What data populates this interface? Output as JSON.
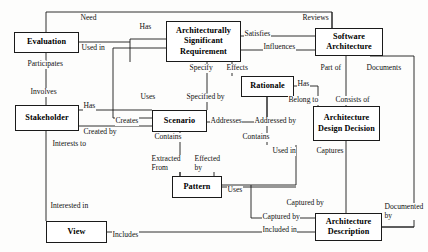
{
  "diagram": {
    "type": "entity-relationship-diagram",
    "stroke_color": "#1a1a1a",
    "background_color": "#fdfdfc",
    "nodes": [
      {
        "id": "evaluation",
        "label": "Evaluation",
        "x": 14,
        "y": 32,
        "w": 65,
        "h": 21
      },
      {
        "id": "stakeholder",
        "label": "Stakeholder",
        "x": 15,
        "y": 105,
        "w": 64,
        "h": 26
      },
      {
        "id": "view",
        "label": "View",
        "x": 46,
        "y": 221,
        "w": 61,
        "h": 22
      },
      {
        "id": "scenario",
        "label": "Scenario",
        "x": 152,
        "y": 110,
        "w": 55,
        "h": 22
      },
      {
        "id": "pattern",
        "label": "Pattern",
        "x": 172,
        "y": 176,
        "w": 50,
        "h": 22
      },
      {
        "id": "asr",
        "label": "Architecturally Significant Requirement",
        "x": 166,
        "y": 21,
        "w": 75,
        "h": 41
      },
      {
        "id": "rationale",
        "label": "Rationale",
        "x": 241,
        "y": 76,
        "w": 53,
        "h": 21
      },
      {
        "id": "software_architecture",
        "label": "Software Architecture",
        "x": 315,
        "y": 28,
        "w": 68,
        "h": 28
      },
      {
        "id": "architecture_design_decision",
        "label": "Architecture Design Decision",
        "x": 313,
        "y": 106,
        "w": 67,
        "h": 35
      },
      {
        "id": "architecture_description",
        "label": "Architecture Description",
        "x": 315,
        "y": 213,
        "w": 67,
        "h": 28
      }
    ],
    "edge_labels": [
      {
        "id": "need",
        "text": "Need",
        "x": 80,
        "y": 14
      },
      {
        "id": "has_top",
        "text": "Has",
        "x": 139,
        "y": 23
      },
      {
        "id": "reviews",
        "text": "Reviews",
        "x": 302,
        "y": 14
      },
      {
        "id": "satisfies",
        "text": "Satisfies",
        "x": 244,
        "y": 33
      },
      {
        "id": "influences",
        "text": "Influences",
        "x": 273,
        "y": 45
      },
      {
        "id": "used_in_top",
        "text": "Used in",
        "x": 81,
        "y": 44
      },
      {
        "id": "participates",
        "text": "Participates",
        "x": 27,
        "y": 59
      },
      {
        "id": "specify",
        "text": "Specify",
        "x": 190,
        "y": 65
      },
      {
        "id": "effects",
        "text": "Effects",
        "x": 227,
        "y": 66
      },
      {
        "id": "part_of",
        "text": "Part of",
        "x": 320,
        "y": 65
      },
      {
        "id": "documents",
        "text": "Documents",
        "x": 370,
        "y": 65
      },
      {
        "id": "involves",
        "text": "Involves",
        "x": 30,
        "y": 88
      },
      {
        "id": "has_rat",
        "text": "Has",
        "x": 296,
        "y": 80
      },
      {
        "id": "uses_scn",
        "text": "Uses",
        "x": 142,
        "y": 93
      },
      {
        "id": "specified_by",
        "text": "Specified by",
        "x": 186,
        "y": 93
      },
      {
        "id": "has_stk",
        "text": "Has",
        "x": 82,
        "y": 102
      },
      {
        "id": "belong_to",
        "text": "Belong to",
        "x": 289,
        "y": 97
      },
      {
        "id": "consists_of",
        "text": "Consists of",
        "x": 338,
        "y": 97
      },
      {
        "id": "creates",
        "text": "Creates",
        "x": 117,
        "y": 116
      },
      {
        "id": "addresses",
        "text": "Addresses",
        "x": 211,
        "y": 116
      },
      {
        "id": "addressed_by",
        "text": "Addressed by",
        "x": 258,
        "y": 116
      },
      {
        "id": "created_by",
        "text": "Created by",
        "x": 82,
        "y": 131
      },
      {
        "id": "contains_scn",
        "text": "Contains",
        "x": 155,
        "y": 133
      },
      {
        "id": "interests_to",
        "text": "Interests to",
        "x": 52,
        "y": 141
      },
      {
        "id": "contains_rat",
        "text": "Contains",
        "x": 243,
        "y": 133
      },
      {
        "id": "used_in_add",
        "text": "Used in",
        "x": 273,
        "y": 148
      },
      {
        "id": "captures",
        "text": "Captures",
        "x": 318,
        "y": 148
      },
      {
        "id": "extracted_from",
        "text": "Extracted From",
        "x": 152,
        "y": 158
      },
      {
        "id": "effected_by",
        "text": "Effected by",
        "x": 197,
        "y": 155
      },
      {
        "id": "uses_pat",
        "text": "Uses",
        "x": 228,
        "y": 187
      },
      {
        "id": "interested_in",
        "text": "Interested in",
        "x": 50,
        "y": 202
      },
      {
        "id": "captured_by_ad",
        "text": "Captured by",
        "x": 288,
        "y": 199
      },
      {
        "id": "documented_by",
        "text": "Documented by",
        "x": 385,
        "y": 203
      },
      {
        "id": "captured_by",
        "text": "Captured by",
        "x": 263,
        "y": 214
      },
      {
        "id": "included_in",
        "text": "Included in",
        "x": 263,
        "y": 226
      },
      {
        "id": "includes",
        "text": "Includes",
        "x": 112,
        "y": 232
      }
    ]
  }
}
